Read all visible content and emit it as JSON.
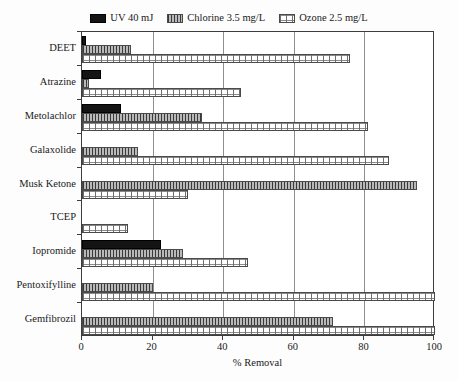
{
  "legend": {
    "entries": [
      {
        "label": "UV 40 mJ",
        "key": "uv",
        "swatch": "solid-black-swatch"
      },
      {
        "label": "Chlorine 3.5 mg/L",
        "key": "chlorine",
        "swatch": "vertical-hatch-swatch"
      },
      {
        "label": "Ozone 2.5 mg/L",
        "key": "ozone",
        "swatch": "dotted-swatch"
      }
    ]
  },
  "axes": {
    "xlabel": "% Removal",
    "xticks": [
      "0",
      "20",
      "40",
      "60",
      "80",
      "100"
    ],
    "xmin": 0,
    "xmax": 100
  },
  "colors": {
    "uv": "#141414",
    "chlorine": "#b9b9b9",
    "ozone": "#ffffff",
    "axis": "#3c3c3c",
    "grid": "#8e8e8e"
  },
  "chart_data": {
    "type": "bar",
    "orientation": "horizontal",
    "title": "",
    "xlabel": "% Removal",
    "ylabel": "",
    "xlim": [
      0,
      100
    ],
    "xticks": [
      0,
      20,
      40,
      60,
      80,
      100
    ],
    "grid": true,
    "legend_position": "top-center",
    "categories": [
      "DEET",
      "Atrazine",
      "Metolachlor",
      "Galaxolide",
      "Musk Ketone",
      "TCEP",
      "Iopromide",
      "Pentoxifylline",
      "Gemfibrozil"
    ],
    "series": [
      {
        "name": "UV 40 mJ",
        "key": "uv",
        "values": [
          1,
          5.5,
          11,
          0,
          0,
          0,
          22.5,
          0,
          0
        ]
      },
      {
        "name": "Chlorine 3.5 mg/L",
        "key": "chlorine",
        "values": [
          14,
          2,
          34,
          16,
          95,
          0,
          28.5,
          20,
          71
        ]
      },
      {
        "name": "Ozone 2.5 mg/L",
        "key": "ozone",
        "values": [
          76,
          45,
          81,
          87,
          30,
          13,
          47,
          100,
          100
        ]
      }
    ]
  }
}
